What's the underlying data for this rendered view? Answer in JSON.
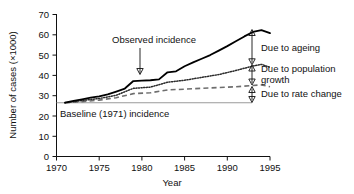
{
  "chart_data": {
    "type": "line",
    "title": "",
    "xlabel": "Year",
    "ylabel": "Number of cases (×1000)",
    "xlim": [
      1970,
      1995
    ],
    "ylim": [
      0,
      70
    ],
    "xticks": [
      1970,
      1975,
      1980,
      1985,
      1990,
      1995
    ],
    "yticks": [
      0,
      10,
      20,
      30,
      40,
      50,
      60,
      70
    ],
    "grid": false,
    "legend_position": "none",
    "baseline_value": 26.5,
    "series": [
      {
        "name": "Observed incidence",
        "style": "solid",
        "x": [
          1971,
          1972,
          1973,
          1974,
          1975,
          1976,
          1977,
          1978,
          1979,
          1980,
          1981,
          1982,
          1983,
          1984,
          1985,
          1986,
          1987,
          1988,
          1989,
          1990,
          1991,
          1992,
          1993,
          1994,
          1995
        ],
        "values": [
          26.5,
          27.4,
          28.2,
          29.0,
          29.6,
          30.6,
          32.0,
          33.5,
          37.2,
          37.4,
          37.6,
          38.0,
          41.5,
          42.0,
          44.5,
          46.4,
          48.2,
          50.0,
          52.2,
          54.4,
          56.8,
          59.2,
          61.4,
          62.3,
          60.8
        ]
      },
      {
        "name": "Due to population growth and rate change",
        "style": "dotted",
        "x": [
          1971,
          1973,
          1975,
          1977,
          1979,
          1981,
          1983,
          1985,
          1987,
          1989,
          1991,
          1993,
          1994,
          1995
        ],
        "values": [
          26.5,
          27.6,
          28.6,
          30.2,
          33.6,
          34.2,
          36.6,
          37.6,
          39.0,
          40.4,
          42.4,
          44.6,
          45.4,
          44.0
        ]
      },
      {
        "name": "Due to rate change",
        "style": "dashed",
        "x": [
          1971,
          1973,
          1975,
          1977,
          1979,
          1981,
          1983,
          1985,
          1987,
          1989,
          1991,
          1993,
          1994,
          1995
        ],
        "values": [
          26.5,
          27.0,
          27.8,
          29.0,
          31.0,
          31.4,
          32.8,
          33.2,
          33.6,
          34.0,
          34.4,
          35.0,
          35.3,
          34.4
        ]
      }
    ],
    "annotations": [
      {
        "name": "observed-incidence",
        "text": "Observed incidence",
        "pointer": "down-arrow",
        "target_year": 1983,
        "target_value": 41.5
      },
      {
        "name": "due-to-ageing",
        "text": "Due to ageing",
        "pointer": "double-arrow",
        "span_value_top": 62.3,
        "span_value_bottom": 45.4
      },
      {
        "name": "due-to-population-growth",
        "text": "Due to population growth",
        "pointer": "double-arrow",
        "span_value_top": 45.4,
        "span_value_bottom": 35.3
      },
      {
        "name": "due-to-rate-change",
        "text": "Due to rate change",
        "pointer": "double-arrow",
        "span_value_top": 35.3,
        "span_value_bottom": 26.5
      },
      {
        "name": "baseline-incidence",
        "text": "Baseline (1971) incidence",
        "pointer": "none",
        "target_value": 26.5
      }
    ]
  },
  "axes": {
    "y_title": "Number of cases (×1000)",
    "x_title": "Year",
    "y_tick_labels": [
      "70",
      "60",
      "50",
      "40",
      "30",
      "20",
      "10",
      "0"
    ],
    "x_tick_labels": [
      "1970",
      "1975",
      "1980",
      "1985",
      "1990",
      "1995"
    ]
  },
  "labels": {
    "observed_incidence": "Observed incidence",
    "due_to_ageing": "Due to ageing",
    "due_to_population_line1": "Due to population",
    "due_to_population_line2": "growth",
    "due_to_rate_change": "Due to rate change",
    "baseline_incidence": "Baseline (1971) incidence"
  },
  "colors": {
    "axis": "#111111",
    "observed": "#000000",
    "population": "#2b2b2b",
    "rate": "#6e6e6e",
    "baseline": "#9a9a9a",
    "background": "#ffffff"
  }
}
